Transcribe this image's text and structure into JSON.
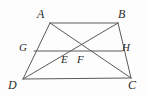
{
  "figure": {
    "name": "trapezoid-with-midsegment-and-diagonals",
    "width": 148,
    "height": 97,
    "background_color": "#fdfdfd",
    "stroke_color": "#5a5a5a",
    "stroke_width": 1,
    "label_color": "#2b2b2b"
  },
  "points": {
    "A": {
      "label": "A",
      "x": 50,
      "y": 23,
      "label_x": 37,
      "label_y": 8
    },
    "B": {
      "label": "B",
      "x": 118,
      "y": 23,
      "label_x": 118,
      "label_y": 8
    },
    "C": {
      "label": "C",
      "x": 131,
      "y": 78,
      "label_x": 128,
      "label_y": 79
    },
    "D": {
      "label": "D",
      "x": 23,
      "y": 79,
      "label_x": 8,
      "label_y": 79
    },
    "G": {
      "label": "G",
      "x": 34,
      "y": 51,
      "label_x": 19,
      "label_y": 42
    },
    "H": {
      "label": "H",
      "x": 122,
      "y": 51,
      "label_x": 122,
      "label_y": 42
    },
    "E": {
      "label": "E",
      "x": 64,
      "y": 51,
      "label_x": 61,
      "label_y": 54
    },
    "F": {
      "label": "F",
      "x": 81,
      "y": 51,
      "label_x": 77,
      "label_y": 54
    }
  },
  "segments": [
    {
      "name": "side-AB",
      "from": "A",
      "to": "B"
    },
    {
      "name": "side-BC",
      "from": "B",
      "to": "C"
    },
    {
      "name": "side-DC",
      "from": "D",
      "to": "C"
    },
    {
      "name": "side-AD",
      "from": "A",
      "to": "D"
    },
    {
      "name": "midsegment-GH",
      "from": "G",
      "to": "H"
    },
    {
      "name": "diagonal-AC",
      "from": "A",
      "to": "C"
    },
    {
      "name": "diagonal-BD",
      "from": "B",
      "to": "D"
    }
  ],
  "labels_order": [
    "A",
    "B",
    "G",
    "H",
    "E",
    "F",
    "D",
    "C"
  ]
}
